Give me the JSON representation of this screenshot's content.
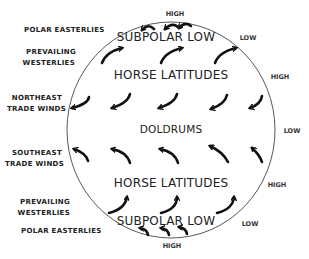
{
  "diagram": {
    "type": "global-wind-circulation",
    "wind_labels": {
      "north_polar_easterlies": "POLAR  EASTERLIES",
      "north_westerlies_line1": "PREVAILING",
      "north_westerlies_line2": "WESTERLIES",
      "northeast_trades_line1": "NORTHEAST",
      "northeast_trades_line2": "TRADE  WINDS",
      "southeast_trades_line1": "SOUTHEAST",
      "southeast_trades_line2": "TRADE  WINDS",
      "south_westerlies_line1": "PREVAILING",
      "south_westerlies_line2": "WESTERLIES",
      "south_polar_easterlies": "POLAR  EASTERLIES"
    },
    "zones": {
      "north_subpolar": "SUBPOLAR  LOW",
      "north_horse": "HORSE   LATITUDES",
      "doldrums": "DOLDRUMS",
      "south_horse": "HORSE   LATITUDES",
      "south_subpolar": "SUBPOLAR  LOW"
    },
    "pressure": {
      "north_pole": "HIGH",
      "north_subpolar": "LOW",
      "north_horse": "HIGH",
      "equator": "LOW",
      "south_horse": "HIGH",
      "south_subpolar": "LOW",
      "south_pole": "HIGH"
    },
    "arrow_rows": [
      {
        "band": "north-polar",
        "direction": "westward",
        "count": 3
      },
      {
        "band": "north-westerlies",
        "direction": "northeastward",
        "count": 3
      },
      {
        "band": "northeast-trades",
        "direction": "southwestward",
        "count": 5
      },
      {
        "band": "southeast-trades",
        "direction": "northwestward",
        "count": 5
      },
      {
        "band": "south-westerlies",
        "direction": "northeastward",
        "count": 3
      },
      {
        "band": "south-polar",
        "direction": "westward",
        "count": 3
      }
    ]
  }
}
